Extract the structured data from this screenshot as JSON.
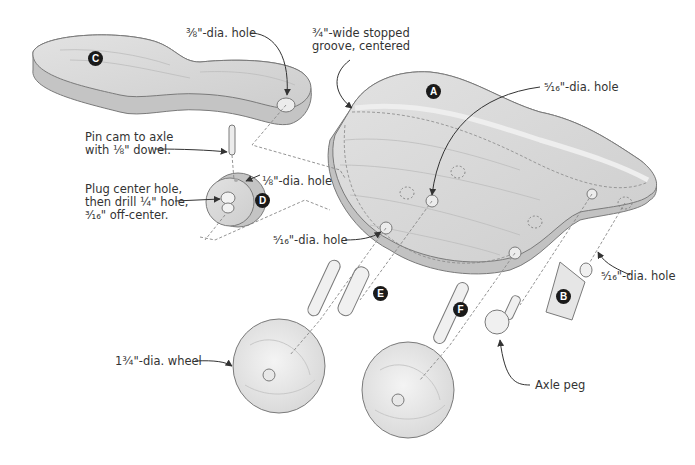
{
  "diagram": {
    "type": "exploded-assembly",
    "parts": [
      {
        "id": "A",
        "label": "A",
        "name": "body"
      },
      {
        "id": "B",
        "label": "B",
        "name": "tail piece"
      },
      {
        "id": "C",
        "label": "C",
        "name": "arm"
      },
      {
        "id": "D",
        "label": "D",
        "name": "cam"
      },
      {
        "id": "E",
        "label": "E",
        "name": "axle"
      },
      {
        "id": "F",
        "label": "F",
        "name": "axle"
      }
    ],
    "callouts": {
      "arm_hole": "⅜\"-dia. hole",
      "groove_line1": "¾\"-wide stopped",
      "groove_line2": "groove, centered",
      "body_top_hole": "⁵⁄₁₆\"-dia. hole",
      "pin_line1": "Pin cam to axle",
      "pin_line2": "with ⅛\" dowel.",
      "cam_small_hole": "⅛\"-dia. hole",
      "plug_line1": "Plug center hole,",
      "plug_line2": "then drill ¼\" hole,",
      "plug_line3": "³⁄₁₆\" off-center.",
      "body_front_hole": "⁵⁄₁₆\"-dia. hole",
      "tail_hole": "⁵⁄₁₆\"-dia. hole",
      "wheel": "1¾\"-dia. wheel",
      "axle_peg": "Axle peg"
    },
    "colors": {
      "wood_face": "#d6d6d6",
      "wood_edge": "#c2c2c2",
      "grain": "#bdbdbd",
      "outline": "#7a7a7a",
      "leader": "#333333",
      "badge": "#1a1a1a",
      "text": "#333333"
    }
  }
}
